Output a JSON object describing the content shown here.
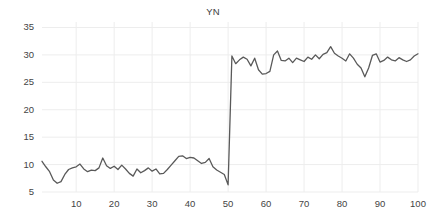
{
  "chart_data": {
    "type": "line",
    "title": "YN",
    "xlabel": "",
    "ylabel": "",
    "xlim": [
      1,
      100
    ],
    "ylim": [
      5,
      36
    ],
    "grid": true,
    "legend": null,
    "legend_position": "none",
    "line_color": "#595959",
    "grid_color": "#ededed",
    "tick_color": "#444444",
    "xticks": [
      10,
      20,
      30,
      40,
      50,
      60,
      70,
      80,
      90,
      100
    ],
    "yticks": [
      5,
      10,
      15,
      20,
      25,
      30,
      35
    ],
    "series": [
      {
        "name": "YN",
        "x": [
          1,
          2,
          3,
          4,
          5,
          6,
          7,
          8,
          9,
          10,
          11,
          12,
          13,
          14,
          15,
          16,
          17,
          18,
          19,
          20,
          21,
          22,
          23,
          24,
          25,
          26,
          27,
          28,
          29,
          30,
          31,
          32,
          33,
          34,
          35,
          36,
          37,
          38,
          39,
          40,
          41,
          42,
          43,
          44,
          45,
          46,
          47,
          48,
          49,
          50,
          51,
          52,
          53,
          54,
          55,
          56,
          57,
          58,
          59,
          60,
          61,
          62,
          63,
          64,
          65,
          66,
          67,
          68,
          69,
          70,
          71,
          72,
          73,
          74,
          75,
          76,
          77,
          78,
          79,
          80,
          81,
          82,
          83,
          84,
          85,
          86,
          87,
          88,
          89,
          90,
          91,
          92,
          93,
          94,
          95,
          96,
          97,
          98,
          99,
          100
        ],
        "values": [
          10.6,
          9.6,
          8.7,
          7.2,
          6.6,
          6.9,
          8.2,
          9.1,
          9.4,
          9.6,
          10.1,
          9.2,
          8.7,
          9.0,
          8.9,
          9.4,
          11.2,
          9.8,
          9.3,
          9.7,
          9.1,
          9.9,
          9.2,
          8.4,
          7.9,
          9.2,
          8.5,
          8.9,
          9.4,
          8.8,
          9.2,
          8.3,
          8.4,
          9.1,
          9.9,
          10.7,
          11.5,
          11.6,
          11.1,
          11.3,
          11.2,
          10.7,
          10.2,
          10.4,
          11.1,
          9.6,
          9.0,
          8.6,
          8.2,
          6.3,
          29.8,
          28.4,
          29.1,
          29.6,
          29.2,
          28.0,
          29.4,
          27.3,
          26.5,
          26.6,
          27.0,
          30.0,
          30.7,
          29.0,
          28.9,
          29.4,
          28.6,
          29.4,
          29.1,
          28.8,
          29.6,
          29.2,
          30.0,
          29.3,
          30.1,
          30.4,
          31.5,
          30.3,
          29.8,
          29.4,
          28.9,
          30.2,
          29.4,
          28.3,
          27.6,
          26.0,
          27.6,
          29.9,
          30.2,
          28.7,
          29.0,
          29.6,
          29.1,
          28.9,
          29.5,
          29.1,
          28.8,
          29.1,
          29.8,
          30.2
        ]
      }
    ]
  }
}
